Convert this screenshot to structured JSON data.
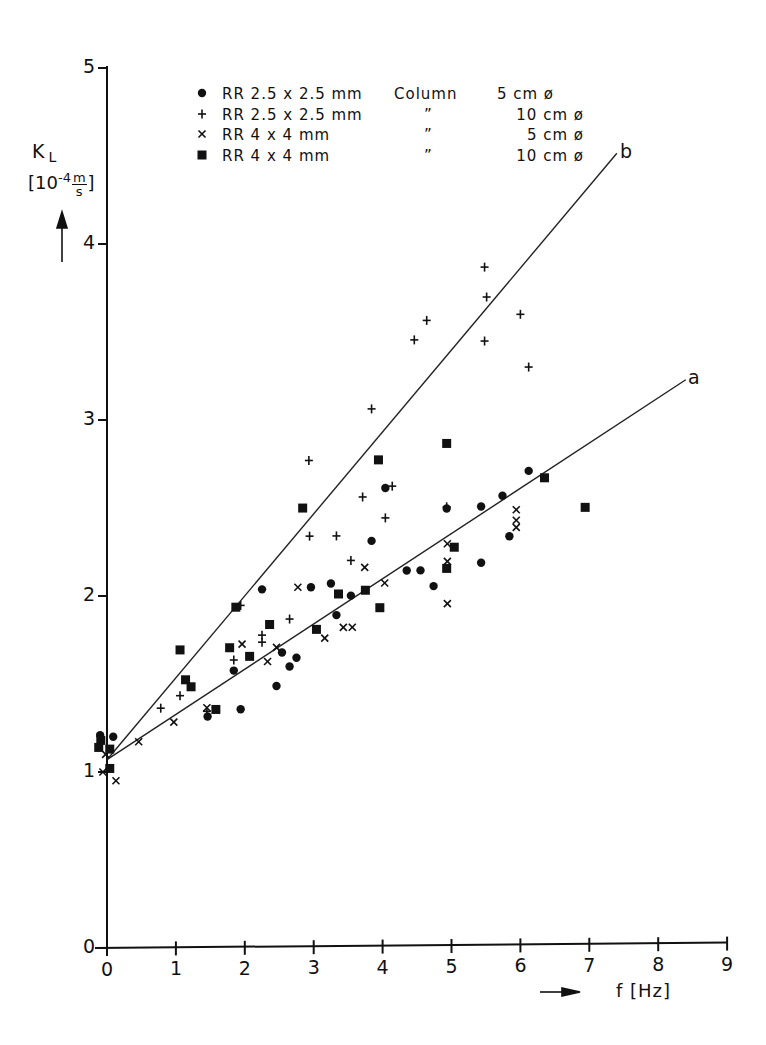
{
  "chart_data": {
    "type": "scatter",
    "title": "",
    "xlabel": "f [Hz]",
    "ylabel": "K_L [10^-4 m/s]",
    "ylabel_parts": {
      "symbol": "K",
      "subscript": "L",
      "unit": "[10⁻⁴ m/s]"
    },
    "xlim": [
      0,
      9
    ],
    "ylim": [
      0,
      5
    ],
    "x_ticks": [
      "0",
      "1",
      "2",
      "3",
      "4",
      "5",
      "6",
      "7",
      "8",
      "9"
    ],
    "y_ticks": [
      "0",
      "1",
      "2",
      "3",
      "4",
      "5"
    ],
    "grid": false,
    "legend_position": "top-left inside",
    "legend": [
      {
        "marker": "circle",
        "symbol": "●",
        "packing": "RR 2.5 x 2.5 mm",
        "column_label": "Column",
        "diameter": "5 cm ø"
      },
      {
        "marker": "plus",
        "symbol": "+",
        "packing": "RR 2.5 x 2.5 mm",
        "column_label": "”",
        "diameter": "10 cm ø"
      },
      {
        "marker": "cross",
        "symbol": "×",
        "packing": "RR 4 x 4 mm",
        "column_label": "”",
        "diameter": "5 cm ø"
      },
      {
        "marker": "square",
        "symbol": "■",
        "packing": "RR 4 x 4 mm",
        "column_label": "”",
        "diameter": "10 cm ø"
      }
    ],
    "series": [
      {
        "name": "RR 2.5x2.5 mm, Column 5 cm ø",
        "marker": "circle",
        "points": [
          [
            -0.1,
            1.21
          ],
          [
            0.09,
            1.2
          ],
          [
            1.46,
            1.31
          ],
          [
            1.94,
            1.35
          ],
          [
            1.84,
            1.57
          ],
          [
            2.25,
            2.03
          ],
          [
            2.46,
            1.48
          ],
          [
            2.54,
            1.67
          ],
          [
            2.65,
            1.59
          ],
          [
            2.75,
            1.64
          ],
          [
            2.96,
            2.04
          ],
          [
            3.25,
            2.06
          ],
          [
            3.33,
            1.88
          ],
          [
            3.54,
            1.99
          ],
          [
            3.84,
            2.3
          ],
          [
            4.04,
            2.6
          ],
          [
            4.35,
            2.13
          ],
          [
            4.55,
            2.13
          ],
          [
            4.74,
            2.04
          ],
          [
            4.93,
            2.48
          ],
          [
            5.43,
            2.49
          ],
          [
            5.43,
            2.17
          ],
          [
            5.74,
            2.55
          ],
          [
            5.84,
            2.32
          ],
          [
            6.12,
            2.69
          ]
        ]
      },
      {
        "name": "RR 2.5x2.5 mm, Column 10 cm ø",
        "marker": "plus",
        "points": [
          [
            0.78,
            1.36
          ],
          [
            1.06,
            1.43
          ],
          [
            1.45,
            1.34
          ],
          [
            1.84,
            1.63
          ],
          [
            1.94,
            1.94
          ],
          [
            2.25,
            1.77
          ],
          [
            2.25,
            1.73
          ],
          [
            2.65,
            1.86
          ],
          [
            2.93,
            2.76
          ],
          [
            2.94,
            2.33
          ],
          [
            3.33,
            2.33
          ],
          [
            3.54,
            2.19
          ],
          [
            3.71,
            2.55
          ],
          [
            3.84,
            3.05
          ],
          [
            4.04,
            2.43
          ],
          [
            4.14,
            2.61
          ],
          [
            4.46,
            3.44
          ],
          [
            4.64,
            3.55
          ],
          [
            4.93,
            2.49
          ],
          [
            5.48,
            3.43
          ],
          [
            5.51,
            3.68
          ],
          [
            5.48,
            3.85
          ],
          [
            6.12,
            3.28
          ],
          [
            6.0,
            3.58
          ]
        ]
      },
      {
        "name": "RR 4x4 mm, Column 5 cm ø",
        "marker": "cross",
        "points": [
          [
            -0.06,
            1.0
          ],
          [
            -0.02,
            1.1
          ],
          [
            0.13,
            0.95
          ],
          [
            0.46,
            1.17
          ],
          [
            0.97,
            1.28
          ],
          [
            1.45,
            1.36
          ],
          [
            1.96,
            1.72
          ],
          [
            2.33,
            1.62
          ],
          [
            2.46,
            1.7
          ],
          [
            2.77,
            2.04
          ],
          [
            3.16,
            1.75
          ],
          [
            3.43,
            1.81
          ],
          [
            3.56,
            1.81
          ],
          [
            3.74,
            2.15
          ],
          [
            4.03,
            2.06
          ],
          [
            4.94,
            2.28
          ],
          [
            4.94,
            2.18
          ],
          [
            4.94,
            1.94
          ],
          [
            5.94,
            2.47
          ],
          [
            5.94,
            2.41
          ],
          [
            5.94,
            2.37
          ]
        ]
      },
      {
        "name": "RR 4x4 mm, Column 10 cm ø",
        "marker": "square",
        "points": [
          [
            -0.09,
            1.18
          ],
          [
            -0.12,
            1.14
          ],
          [
            0.04,
            1.13
          ],
          [
            0.04,
            1.02
          ],
          [
            1.06,
            1.69
          ],
          [
            1.14,
            1.52
          ],
          [
            1.22,
            1.48
          ],
          [
            1.58,
            1.35
          ],
          [
            1.78,
            1.7
          ],
          [
            1.87,
            1.93
          ],
          [
            2.07,
            1.65
          ],
          [
            2.36,
            1.83
          ],
          [
            2.84,
            2.49
          ],
          [
            3.04,
            1.8
          ],
          [
            3.36,
            2.0
          ],
          [
            3.75,
            2.02
          ],
          [
            3.94,
            2.76
          ],
          [
            3.96,
            1.92
          ],
          [
            4.93,
            2.85
          ],
          [
            4.93,
            2.14
          ],
          [
            5.04,
            2.26
          ],
          [
            6.35,
            2.65
          ],
          [
            6.94,
            2.48
          ]
        ]
      }
    ],
    "fit_lines": [
      {
        "label": "a",
        "x": [
          0,
          8.4
        ],
        "y": [
          1.07,
          3.2
        ]
      },
      {
        "label": "b",
        "x": [
          0,
          7.4
        ],
        "y": [
          1.07,
          4.49
        ]
      }
    ],
    "annotations": [
      "a",
      "b",
      "→ (x-axis arrow)",
      "↑ (y-axis arrow)"
    ]
  },
  "labels": {
    "y_symbol": "K",
    "y_sub": "L",
    "y_unit_open": "[10",
    "y_unit_exp": "-4",
    "y_unit_num": "m",
    "y_unit_den": "s",
    "y_unit_close": "]",
    "x_label": "f [Hz]",
    "line_a": "a",
    "line_b": "b"
  }
}
